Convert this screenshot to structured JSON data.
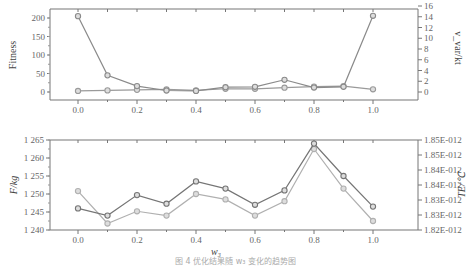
{
  "caption": "图 4  优化结果随 w₃ 变化的趋势图",
  "chart_data": [
    {
      "type": "line",
      "title": "",
      "xlabel": "",
      "ylabel": "Fitness",
      "y2label": "v_var/kt",
      "x": [
        0.0,
        0.1,
        0.2,
        0.3,
        0.4,
        0.5,
        0.6,
        0.7,
        0.8,
        0.9,
        1.0
      ],
      "xticks": [
        "0.0",
        "0.2",
        "0.4",
        "0.6",
        "0.8",
        "1.0"
      ],
      "xlim": [
        -0.08,
        1.17
      ],
      "ylim": [
        -10,
        220
      ],
      "yticks": [
        "0",
        "50",
        "100",
        "150",
        "200"
      ],
      "y2lim": [
        -0.8,
        16
      ],
      "y2ticks": [
        "0",
        "2",
        "4",
        "6",
        "8",
        "10",
        "12",
        "14",
        "16"
      ],
      "grid": false,
      "legend": "none",
      "series": [
        {
          "name": "Fitness",
          "axis": "left",
          "color": "#888888",
          "values": [
            205,
            45,
            16,
            4,
            3,
            13,
            14,
            33,
            12,
            14,
            206
          ]
        },
        {
          "name": "v_var/kt",
          "axis": "right",
          "color": "#999999",
          "values": [
            0.2,
            0.3,
            0.4,
            0.5,
            0.3,
            0.6,
            0.6,
            0.8,
            1.0,
            1.1,
            0.5
          ]
        }
      ]
    },
    {
      "type": "line",
      "title": "",
      "xlabel": "w3",
      "ylabel": "F/kg",
      "y2label": "TE/℃",
      "x": [
        0.0,
        0.1,
        0.2,
        0.3,
        0.4,
        0.5,
        0.6,
        0.7,
        0.8,
        0.9,
        1.0
      ],
      "xticks": [
        "0.0",
        "0.2",
        "0.4",
        "0.6",
        "0.8",
        "1.0"
      ],
      "xlim": [
        -0.08,
        1.17
      ],
      "ylim": [
        1.24,
        1.265
      ],
      "yticks": [
        "1.240",
        "1.245",
        "1.250",
        "1.255",
        "1.260",
        "1.265"
      ],
      "y2ticks": [
        "1.82E-012",
        "1.83E-012",
        "1.83E-012",
        "1.84E-012",
        "1.84E-012",
        "1.85E-012",
        "1.85E-012"
      ],
      "grid": false,
      "legend": "none",
      "series": [
        {
          "name": "F",
          "axis": "left",
          "color": "#777777",
          "values": [
            1.246,
            1.244,
            1.2497,
            1.2473,
            1.2535,
            1.2515,
            1.247,
            1.251,
            1.264,
            1.255,
            1.2465
          ]
        },
        {
          "name": "TE",
          "axis": "right",
          "color": "#aaaaaa",
          "values_on_left_scale": [
            1.2508,
            1.2418,
            1.2452,
            1.244,
            1.25,
            1.2485,
            1.244,
            1.248,
            1.2625,
            1.2515,
            1.2425
          ]
        }
      ]
    }
  ]
}
